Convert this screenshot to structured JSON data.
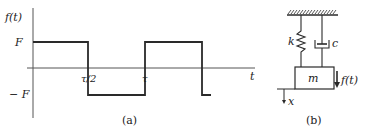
{
  "figure_a": {
    "caption": "(a)",
    "y_axis_label": "f(t)",
    "x_axis_label": "t",
    "level_high": "F",
    "level_low": "− F",
    "tick_half_period": "τ/2",
    "tick_period": "τ",
    "waveform": "square wave alternating between F and -F with period τ"
  },
  "figure_b": {
    "caption": "(b)",
    "spring_label": "k",
    "damper_label": "c",
    "mass_label": "m",
    "force_label": "f(t)",
    "displacement_label": "x"
  },
  "colors": {
    "line": "#2a2a2a",
    "axis": "#555555",
    "background": "#ffffff"
  }
}
